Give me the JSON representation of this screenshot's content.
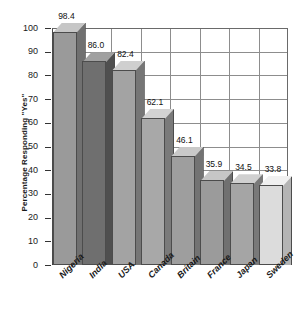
{
  "figure": {
    "title_strip_text": "",
    "background": "#ffffff"
  },
  "chart_data": {
    "type": "bar",
    "title": "",
    "subtitle": "",
    "xlabel": "",
    "ylabel": "Percentage Responding \"Yes\"",
    "categories": [
      "Nigeria",
      "India",
      "USA",
      "Canada",
      "Britain",
      "France",
      "Japan",
      "Sweden"
    ],
    "values": [
      98.4,
      86.0,
      82.4,
      62.1,
      46.1,
      35.9,
      34.5,
      33.8
    ],
    "data_labels": [
      "98.4",
      "86.0",
      "82.4",
      "62.1",
      "46.1",
      "35.9",
      "34.5",
      "33.8"
    ],
    "ylim": [
      0,
      100
    ],
    "yticks": [
      0,
      10,
      20,
      30,
      40,
      50,
      60,
      70,
      80,
      90,
      100
    ],
    "ytick_labels": [
      "0",
      "10",
      "20",
      "30",
      "40",
      "50",
      "60",
      "70",
      "80",
      "90",
      "100"
    ],
    "grid": true,
    "grid_axis": "both",
    "legend": false,
    "legend_position": "none",
    "style": "3d-bar",
    "bar_colors": [
      "#9a9a9a",
      "#6f6f6f",
      "#a3a3a3",
      "#a8a8a8",
      "#9e9e9e",
      "#9b9b9b",
      "#a5a5a5",
      "#dcdcdc"
    ],
    "bar_top_colors": [
      "#c6c6c6",
      "#a0a0a0",
      "#cfcfcf",
      "#d2d2d2",
      "#c9c9c9",
      "#c6c6c6",
      "#d0d0d0",
      "#f0f0f0"
    ],
    "bar_side_colors": [
      "#707070",
      "#4f4f4f",
      "#767676",
      "#7a7a7a",
      "#737373",
      "#707070",
      "#797979",
      "#b4b4b4"
    ],
    "axis_color": "#333333",
    "grid_color": "#8d8d8d"
  },
  "axis": {
    "ylabel": "Percentage Responding \"Yes\""
  }
}
